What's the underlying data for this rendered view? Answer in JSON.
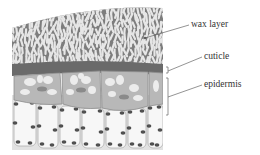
{
  "figure": {
    "labels": [
      {
        "id": "wax",
        "text": "wax layer",
        "x": 191,
        "y": 20
      },
      {
        "id": "cuticle",
        "text": "cuticle",
        "x": 204,
        "y": 52
      },
      {
        "id": "epidermis",
        "text": "epidermis",
        "x": 204,
        "y": 80
      }
    ],
    "colors": {
      "wax_bg": "#7d7d7d",
      "wax_crystal": "#e6e6e6",
      "cuticle": "#6a6a6a",
      "epidermis_cell": "#b8b8b8",
      "epidermis_spot": "#ececec",
      "lower_cell": "#f4f4f4",
      "lower_cell_border": "#b0b0b0",
      "nucleus": "#505050",
      "leader_line": "#666666"
    }
  }
}
